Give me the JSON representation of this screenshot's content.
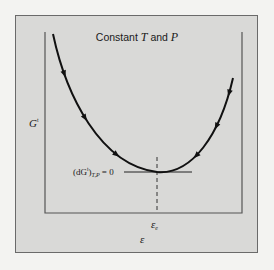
{
  "figure": {
    "title_prefix": "Constant ",
    "title_var1": "T",
    "title_mid": " and ",
    "title_var2": "P",
    "y_axis_label": "G",
    "y_axis_label_sup": "t",
    "x_axis_label": "ε",
    "equilibrium_marker": "ε",
    "equilibrium_marker_sub": "e",
    "condition_open": "(dG",
    "condition_sup": "t",
    "condition_close": ")",
    "condition_sub": "T,P",
    "condition_rhs": " = 0"
  },
  "colors": {
    "page_background": "#f3f3f1",
    "panel_background": "#d9d9d7",
    "curve": "#111111",
    "axes": "#555555",
    "frame": "#6a6a6a"
  },
  "chart_data": {
    "type": "line",
    "title": "Constant T and P",
    "xlabel": "ε",
    "ylabel": "G^t",
    "x_tick_labels": [
      "ε_e"
    ],
    "minimum_at": "ε_e",
    "arrows_left_branch": 3,
    "arrows_right_branch": 3,
    "grid": false
  }
}
